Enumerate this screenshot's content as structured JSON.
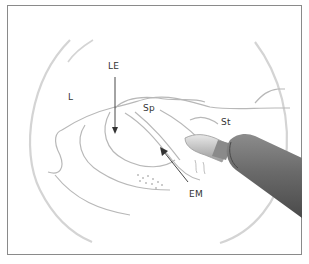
{
  "figure": {
    "labels": {
      "LE": "LE",
      "L": "L",
      "Sp": "Sp",
      "St": "St",
      "EM": "EM"
    },
    "colors": {
      "frame": "#8a8a8a",
      "outline": "#bdbdbd",
      "scope_circle": "#d6d6d6",
      "arrow": "#333333",
      "instrument_dark": "#5a5a5a",
      "instrument_light": "#9a9a9a"
    }
  }
}
